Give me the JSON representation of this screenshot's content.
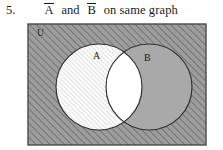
{
  "question": {
    "number": "5.",
    "expression_parts": {
      "a_complement": "A",
      "connector": "and",
      "b_complement": "B",
      "suffix": "on same graph"
    },
    "full_text": "Ā and B̄ on same graph"
  },
  "diagram": {
    "type": "venn-two-set",
    "universe_label": "U",
    "sets": [
      {
        "name": "A",
        "label": "A",
        "fill": "hatch-light",
        "fill_color": "#fdfdfd",
        "hatch_color": "#c9c9c9",
        "cx": 100,
        "cy": 87,
        "r": 43
      },
      {
        "name": "B",
        "label": "B",
        "fill": "solid-gray",
        "fill_color": "#a9a9a9",
        "hatch_color": "",
        "cx": 150,
        "cy": 87,
        "r": 43
      }
    ],
    "universe": {
      "fill": "hatch-dark",
      "fill_color": "#9a9a9a",
      "hatch_color": "#6e6e6e",
      "border_color": "#4a4a4a",
      "x": 28,
      "y": 24,
      "width": 178,
      "height": 121
    },
    "intersection": {
      "label": "",
      "fill": "white",
      "fill_color": "#ffffff",
      "description": "A intersect B left unshaded"
    },
    "shaded_regions": [
      "outside-both-circles",
      "A-only",
      "B-only"
    ],
    "stroke_color": "#333333"
  }
}
